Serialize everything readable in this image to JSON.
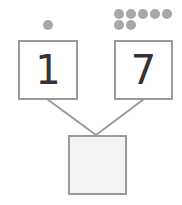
{
  "diagram": {
    "type": "number-bond",
    "colors": {
      "dot": "#a8a8a8",
      "border": "#9a9a9a",
      "line": "#9a9a9a",
      "digit": "#333333",
      "sum_fill": "#f4f4f4"
    },
    "parts": [
      {
        "label": "1",
        "dot_count": 1
      },
      {
        "label": "7",
        "dot_count": 7
      }
    ],
    "whole": {
      "label": ""
    }
  }
}
